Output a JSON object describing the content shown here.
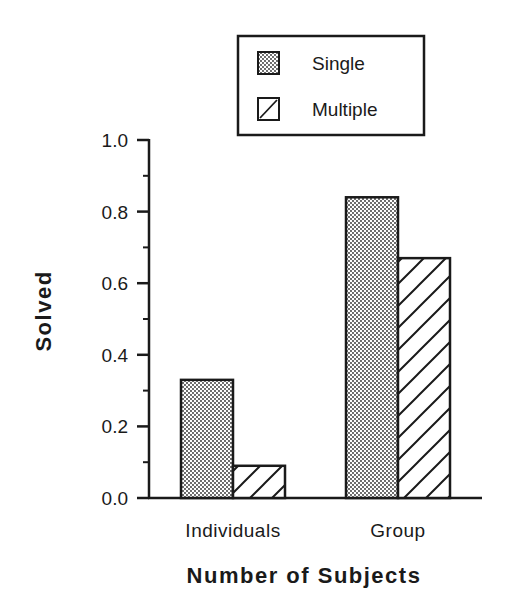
{
  "chart_data": {
    "type": "bar",
    "title": "",
    "xlabel": "Number of Subjects",
    "ylabel": "Solved",
    "categories": [
      "Individuals",
      "Group"
    ],
    "series": [
      {
        "name": "Single",
        "pattern": "stipple",
        "values": [
          0.33,
          0.84
        ]
      },
      {
        "name": "Multiple",
        "pattern": "diagonal-hatch",
        "values": [
          0.09,
          0.67
        ]
      }
    ],
    "ylim": [
      0.0,
      1.0
    ],
    "yticks": [
      "0.0",
      "0.2",
      "0.4",
      "0.6",
      "0.8",
      "1.0"
    ],
    "minor_ticks": true,
    "grid": false,
    "legend_position": "top-right (outside plot, above)"
  },
  "colors": {
    "ink": "#1a1a1a",
    "background": "#ffffff",
    "stipple_fill": "#d8d8d8"
  }
}
